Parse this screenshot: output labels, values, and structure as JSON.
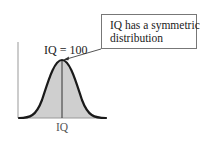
{
  "diagram": {
    "callout": {
      "lines": [
        "IQ has a symmetric",
        "distribution"
      ],
      "text": "IQ has a symmetric distribution"
    },
    "peak_label": "IQ = 100",
    "x_axis_label": "IQ",
    "curve": {
      "type": "normal-distribution",
      "mean_label": "IQ = 100",
      "shape": "symmetric bell curve"
    },
    "colors": {
      "curve_stroke": "#1a1a1a",
      "fill": "#cfcfcf",
      "axis": "#999999",
      "mean_line": "#333333",
      "callout_border": "#777777"
    }
  }
}
